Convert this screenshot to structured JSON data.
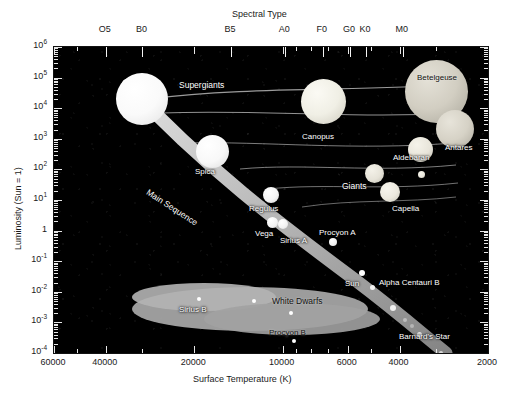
{
  "chart_data": {
    "type": "scatter",
    "xlabel": "Surface Temperature   (K)",
    "ylabel": "Luminosity  (Sun = 1)",
    "top_axis_label": "Spectral Type",
    "xlim": [
      60000,
      2000
    ],
    "ylim": [
      0.0001,
      1000000
    ],
    "x_scale": "log-reversed",
    "y_scale": "log",
    "grid": false,
    "legend": "none",
    "background": "#000000",
    "xticks": [
      "60000",
      "40000",
      "20000",
      "10000",
      "6000",
      "4000",
      "2000"
    ],
    "xtick_values": [
      60000,
      40000,
      20000,
      10000,
      6000,
      4000,
      2000
    ],
    "yticks": [
      "10<sup>6</sup>",
      "10<sup>5</sup>",
      "10<sup>4</sup>",
      "10<sup>3</sup>",
      "10<sup>2</sup>",
      "10<sup>1</sup>",
      "1",
      "10<sup>-1</sup>",
      "10<sup>-2</sup>",
      "10<sup>-3</sup>",
      "10<sup>-4</sup>"
    ],
    "ytick_values": [
      1000000,
      100000,
      10000,
      1000,
      100,
      10,
      1,
      0.1,
      0.01,
      0.001,
      0.0001
    ],
    "spectral_ticks": [
      "O5",
      "B0",
      "B5",
      "A0",
      "F0",
      "G0",
      "K0",
      "M0"
    ],
    "spectral_temps": [
      40000,
      30000,
      15000,
      9800,
      7300,
      5900,
      5200,
      3900
    ],
    "regions": [
      {
        "name": "Supergiants",
        "label": "Supergiants"
      },
      {
        "name": "Giants",
        "label": "Giants"
      },
      {
        "name": "Main Sequence",
        "label": "Main Sequence"
      },
      {
        "name": "White Dwarfs",
        "label": "White Dwarfs"
      }
    ],
    "stars": [
      {
        "name": "Spica",
        "temperature": 22400,
        "luminosity": 2000,
        "label": "Spica"
      },
      {
        "name": "Regulus",
        "temperature": 12500,
        "luminosity": 150,
        "label": "Regulus"
      },
      {
        "name": "Vega",
        "temperature": 9600,
        "luminosity": 40,
        "label": "Vega"
      },
      {
        "name": "Sirius A",
        "temperature": 9200,
        "luminosity": 25,
        "label": "Sirius A"
      },
      {
        "name": "Procyon A",
        "temperature": 6500,
        "luminosity": 7,
        "label": "Procyon A"
      },
      {
        "name": "Capella",
        "temperature": 5000,
        "luminosity": 130,
        "label": "Capella"
      },
      {
        "name": "Canopus",
        "temperature": 7400,
        "luminosity": 14000,
        "label": "Canopus"
      },
      {
        "name": "Betelgeuse",
        "temperature": 3500,
        "luminosity": 50000,
        "label": "Betelgeuse"
      },
      {
        "name": "Antares",
        "temperature": 3400,
        "luminosity": 3000,
        "label": "Antares"
      },
      {
        "name": "Aldebaran",
        "temperature": 3900,
        "luminosity": 400,
        "label": "Aldebaran"
      },
      {
        "name": "Sun",
        "temperature": 5800,
        "luminosity": 1,
        "label": "Sun"
      },
      {
        "name": "Alpha Centauri B",
        "temperature": 5200,
        "luminosity": 0.5,
        "label": "Alpha Centauri B"
      },
      {
        "name": "Barnard's Star",
        "temperature": 3100,
        "luminosity": 0.0005,
        "label": "Barnard's Star"
      },
      {
        "name": "Sirius B",
        "temperature": 24000,
        "luminosity": 0.025,
        "label": "Sirius B"
      },
      {
        "name": "Procyon B",
        "temperature": 7700,
        "luminosity": 0.0006,
        "label": "Procyon B"
      }
    ]
  },
  "axes": {
    "top_title": "Spectral Type",
    "bottom_title": "Surface Temperature   (K)",
    "left_title": "Luminosity  (Sun = 1)",
    "spectral": [
      "O5",
      "B0",
      "B5",
      "A0",
      "F0",
      "G0",
      "K0",
      "M0"
    ],
    "x": [
      "60000",
      "40000",
      "20000",
      "10000",
      "6000",
      "4000",
      "2000"
    ],
    "y": [
      "10⁶",
      "10⁵",
      "10⁴",
      "10³",
      "10²",
      "10¹",
      "1",
      "10⁻¹",
      "10⁻²",
      "10⁻³",
      "10⁻⁴"
    ]
  },
  "labels": {
    "supergiants": "Supergiants",
    "giants": "Giants",
    "main_sequence": "Main Sequence",
    "white_dwarfs": "White Dwarfs",
    "spica": "Spica",
    "regulus": "Regulus",
    "vega": "Vega",
    "sirius_a": "Sirius A",
    "procyon_a": "Procyon A",
    "capella": "Capella",
    "canopus": "Canopus",
    "betelgeuse": "Betelgeuse",
    "antares": "Antares",
    "aldebaran": "Aldebaran",
    "sun": "Sun",
    "alpha_centauri_b": "Alpha Centauri B",
    "barnards_star": "Barnard's Star",
    "sirius_b": "Sirius B",
    "procyon_b": "Procyon B"
  },
  "colors": {
    "background": "#000000",
    "page": "#ffffff",
    "text": "#1a1a1a",
    "label_text": "#ffffff",
    "star_white": "#ffffff",
    "star_warm": "#d8d4cc",
    "band": "#b9b9b9",
    "dwarf_cloud": "#a8a8a8"
  }
}
